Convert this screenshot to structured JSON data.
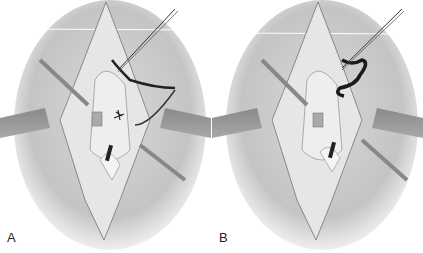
{
  "figure": {
    "panels": [
      {
        "label": "A",
        "description": "Surgical exposure with retractors; suture passed through tissue with loose ends"
      },
      {
        "label": "B",
        "description": "Surgical exposure with retractors; suture tied/looped"
      }
    ]
  }
}
